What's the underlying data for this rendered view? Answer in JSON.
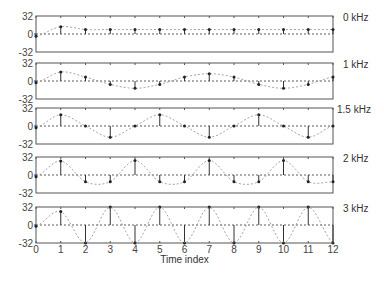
{
  "chart_data": {
    "type": "line",
    "subtype": "stem-with-dashed-envelope",
    "xlabel": "Time index",
    "x": [
      0,
      1,
      2,
      3,
      4,
      5,
      6,
      7,
      8,
      9,
      10,
      11,
      12
    ],
    "x_ticks": [
      "0",
      "1",
      "2",
      "3",
      "4",
      "5",
      "6",
      "7",
      "8",
      "9",
      "10",
      "11",
      "12"
    ],
    "xlim": [
      0,
      12
    ],
    "ylim": [
      -32,
      32
    ],
    "y_ticks": [
      "32",
      "0",
      "-32"
    ],
    "grid": false,
    "panels": [
      {
        "name": "0 kHz",
        "label": "0 kHz",
        "values": [
          -4,
          13,
          8,
          8,
          8,
          8,
          8,
          8,
          8,
          8,
          8,
          8,
          8
        ]
      },
      {
        "name": "1 kHz",
        "label": "1 kHz",
        "values": [
          -3,
          16,
          7,
          -6,
          -13,
          -6,
          7,
          13,
          7,
          -6,
          -13,
          -6,
          7
        ]
      },
      {
        "name": "1.5 kHz",
        "label": "1.5 kHz",
        "values": [
          -3,
          20,
          0,
          -20,
          0,
          20,
          0,
          -20,
          0,
          20,
          0,
          -20,
          0
        ]
      },
      {
        "name": "2 kHz",
        "label": "2 kHz",
        "values": [
          -3,
          25,
          -12,
          -12,
          26,
          -12,
          -12,
          26,
          -12,
          -12,
          26,
          -12,
          -12
        ]
      },
      {
        "name": "3 kHz",
        "label": "3 kHz",
        "values": [
          -2,
          24,
          -32,
          32,
          -32,
          32,
          -32,
          32,
          -32,
          32,
          -32,
          32,
          -32
        ]
      }
    ]
  }
}
